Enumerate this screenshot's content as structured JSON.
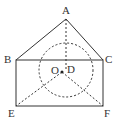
{
  "diagram": {
    "type": "geometry",
    "points": {
      "A": {
        "label": "A",
        "x": 66,
        "y": 19
      },
      "B": {
        "label": "B",
        "x": 16,
        "y": 60
      },
      "C": {
        "label": "C",
        "x": 103,
        "y": 60
      },
      "D": {
        "label": "D",
        "x": 66,
        "y": 64
      },
      "E": {
        "label": "E",
        "x": 16,
        "y": 106
      },
      "F": {
        "label": "F",
        "x": 103,
        "y": 106
      },
      "O": {
        "label": "O",
        "x": 62,
        "y": 72
      }
    },
    "solid_segments": [
      "AB",
      "AC",
      "BC",
      "BE",
      "EF",
      "CF"
    ],
    "dashed_segments": [
      "AD",
      "OE",
      "OF"
    ],
    "circle": {
      "center": "O",
      "radius": 27,
      "style": "dashed"
    },
    "colors": {
      "stroke": "#333333",
      "background": "#ffffff"
    }
  }
}
